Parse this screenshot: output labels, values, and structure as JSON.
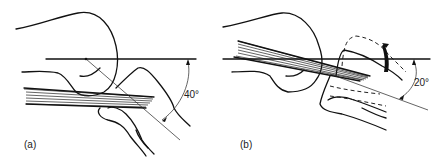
{
  "panels": [
    {
      "id": "a",
      "label": "(a)",
      "angle_label": "40°"
    },
    {
      "id": "b",
      "label": "(b)",
      "angle_label": "20°"
    }
  ]
}
